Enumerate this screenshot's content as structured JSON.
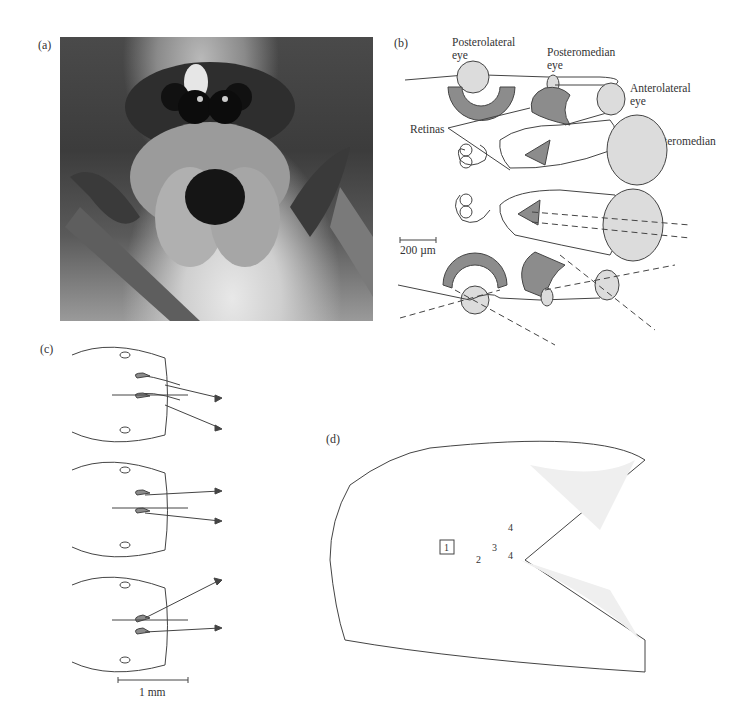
{
  "figure": {
    "panels": {
      "a": {
        "label": "(a)",
        "content": "Photograph of jumping spider face"
      },
      "b": {
        "label": "(b)",
        "labels": {
          "posterolateral": "Posterolateral\neye",
          "posteromedian": "Posteromedian\neye",
          "anterolateral": "Anterolateral\neye",
          "anteromedian": "Anteromedian\neye",
          "retinas": "Retinas"
        },
        "scale_bar": "200 µm"
      },
      "c": {
        "label": "(c)",
        "scale_bar": "1 mm"
      },
      "d": {
        "label": "(d)",
        "numbers": [
          "1",
          "2",
          "3",
          "4",
          "4"
        ]
      }
    },
    "colors": {
      "lens_fill": "#dcdcdc",
      "retina_fill": "#8c8c8c",
      "line": "#444444"
    }
  }
}
